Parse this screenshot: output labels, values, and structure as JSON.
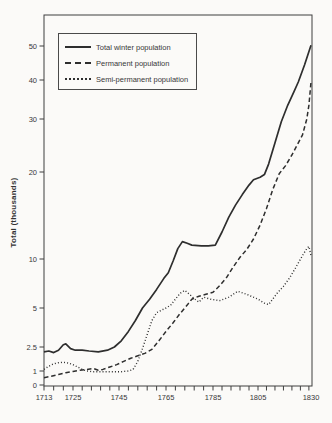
{
  "page": {
    "background": "#fbfaf8"
  },
  "colors": {
    "ink": "#2e2e2e",
    "axis": "#3f3f3f",
    "text": "#383838"
  },
  "y_axis": {
    "title": "Total (thousands)",
    "tick_values": [
      0,
      1,
      2.5,
      5,
      10,
      20,
      30,
      40,
      50
    ],
    "tick_labels": [
      "0",
      "1",
      "2.5",
      "5",
      "10",
      "20",
      "30",
      "40",
      "50"
    ]
  },
  "x_axis": {
    "tick_values": [
      1713,
      1725,
      1745,
      1765,
      1785,
      1805,
      1830
    ],
    "tick_labels": [
      "1713",
      "1725",
      "1745",
      "1765",
      "1785",
      "1805",
      "1830"
    ],
    "minor_tick_step_years": 4
  },
  "legend": {
    "items": [
      {
        "label": "Total winter population",
        "style": "solid"
      },
      {
        "label": "Permanent population",
        "style": "dashed"
      },
      {
        "label": "Semi-permanent population",
        "style": "dotted"
      }
    ]
  },
  "chart_data": {
    "type": "line",
    "title": "",
    "xlabel": "",
    "ylabel": "Total (thousands)",
    "x_range": [
      1713,
      1830
    ],
    "y_tick_values": [
      0,
      1,
      2.5,
      5,
      10,
      20,
      30,
      40,
      50
    ],
    "y_scale_note": "irregular compressed scale (log-like), values in thousands",
    "grid": false,
    "legend_position": "upper-left inside plot",
    "series": [
      {
        "name": "Total winter population",
        "line_style": "solid",
        "points": [
          [
            1713,
            2.2
          ],
          [
            1715,
            2.25
          ],
          [
            1717,
            2.15
          ],
          [
            1719,
            2.3
          ],
          [
            1721,
            2.65
          ],
          [
            1722,
            2.7
          ],
          [
            1724,
            2.4
          ],
          [
            1726,
            2.3
          ],
          [
            1729,
            2.3
          ],
          [
            1732,
            2.25
          ],
          [
            1736,
            2.2
          ],
          [
            1740,
            2.3
          ],
          [
            1743,
            2.5
          ],
          [
            1746,
            2.9
          ],
          [
            1749,
            3.5
          ],
          [
            1752,
            4.2
          ],
          [
            1755,
            5.0
          ],
          [
            1758,
            5.9
          ],
          [
            1761,
            6.9
          ],
          [
            1764,
            8.0
          ],
          [
            1766,
            8.6
          ],
          [
            1768,
            9.8
          ],
          [
            1770,
            11.2
          ],
          [
            1772,
            12.0
          ],
          [
            1774,
            11.8
          ],
          [
            1776,
            11.6
          ],
          [
            1780,
            11.5
          ],
          [
            1783,
            11.5
          ],
          [
            1786,
            11.6
          ],
          [
            1789,
            13.1
          ],
          [
            1792,
            14.8
          ],
          [
            1795,
            16.2
          ],
          [
            1798,
            17.4
          ],
          [
            1801,
            18.5
          ],
          [
            1803,
            19.1
          ],
          [
            1806,
            19.4
          ],
          [
            1808,
            19.7
          ],
          [
            1810,
            21.5
          ],
          [
            1813,
            25.5
          ],
          [
            1816,
            29.5
          ],
          [
            1819,
            33.5
          ],
          [
            1822,
            37.0
          ],
          [
            1824,
            39.5
          ],
          [
            1827,
            44.5
          ],
          [
            1830,
            50.2
          ]
        ]
      },
      {
        "name": "Permanent population",
        "line_style": "dashed",
        "points": [
          [
            1713,
            0.52
          ],
          [
            1716,
            0.62
          ],
          [
            1719,
            0.75
          ],
          [
            1722,
            0.88
          ],
          [
            1725,
            0.97
          ],
          [
            1728,
            1.05
          ],
          [
            1731,
            1.1
          ],
          [
            1734,
            1.15
          ],
          [
            1736,
            1.05
          ],
          [
            1738,
            1.1
          ],
          [
            1741,
            1.25
          ],
          [
            1744,
            1.4
          ],
          [
            1747,
            1.6
          ],
          [
            1750,
            1.8
          ],
          [
            1753,
            1.95
          ],
          [
            1756,
            2.1
          ],
          [
            1759,
            2.35
          ],
          [
            1762,
            2.9
          ],
          [
            1765,
            3.5
          ],
          [
            1768,
            4.05
          ],
          [
            1771,
            4.65
          ],
          [
            1774,
            5.3
          ],
          [
            1776,
            5.9
          ],
          [
            1779,
            6.2
          ],
          [
            1782,
            6.4
          ],
          [
            1785,
            6.6
          ],
          [
            1788,
            7.3
          ],
          [
            1791,
            8.1
          ],
          [
            1794,
            9.2
          ],
          [
            1797,
            10.2
          ],
          [
            1800,
            11.1
          ],
          [
            1803,
            12.3
          ],
          [
            1806,
            13.9
          ],
          [
            1809,
            15.8
          ],
          [
            1812,
            18.0
          ],
          [
            1815,
            19.8
          ],
          [
            1818,
            21.2
          ],
          [
            1821,
            23.2
          ],
          [
            1824,
            25.5
          ],
          [
            1826,
            27.0
          ],
          [
            1828,
            30.0
          ],
          [
            1829,
            33.5
          ],
          [
            1830,
            39.5
          ]
        ]
      },
      {
        "name": "Semi-permanent population",
        "line_style": "dotted",
        "points": [
          [
            1713,
            1.1
          ],
          [
            1715,
            1.3
          ],
          [
            1717,
            1.45
          ],
          [
            1719,
            1.52
          ],
          [
            1721,
            1.55
          ],
          [
            1723,
            1.5
          ],
          [
            1725,
            1.4
          ],
          [
            1727,
            1.25
          ],
          [
            1729,
            1.1
          ],
          [
            1731,
            1.0
          ],
          [
            1734,
            0.95
          ],
          [
            1738,
            0.95
          ],
          [
            1742,
            0.95
          ],
          [
            1746,
            0.95
          ],
          [
            1749,
            1.0
          ],
          [
            1751,
            1.1
          ],
          [
            1753,
            1.6
          ],
          [
            1755,
            2.4
          ],
          [
            1757,
            3.3
          ],
          [
            1759,
            4.2
          ],
          [
            1761,
            4.7
          ],
          [
            1763,
            4.85
          ],
          [
            1765,
            5.0
          ],
          [
            1767,
            5.3
          ],
          [
            1769,
            5.9
          ],
          [
            1771,
            6.5
          ],
          [
            1773,
            6.8
          ],
          [
            1775,
            6.4
          ],
          [
            1777,
            5.95
          ],
          [
            1779,
            5.6
          ],
          [
            1781,
            6.1
          ],
          [
            1784,
            5.9
          ],
          [
            1788,
            5.75
          ],
          [
            1792,
            6.1
          ],
          [
            1796,
            6.7
          ],
          [
            1800,
            6.4
          ],
          [
            1805,
            5.9
          ],
          [
            1808,
            5.5
          ],
          [
            1810,
            5.35
          ],
          [
            1814,
            6.5
          ],
          [
            1817,
            7.2
          ],
          [
            1820,
            8.1
          ],
          [
            1823,
            9.2
          ],
          [
            1826,
            10.4
          ],
          [
            1828,
            11.2
          ],
          [
            1829,
            11.45
          ],
          [
            1830,
            10.4
          ]
        ]
      }
    ]
  }
}
